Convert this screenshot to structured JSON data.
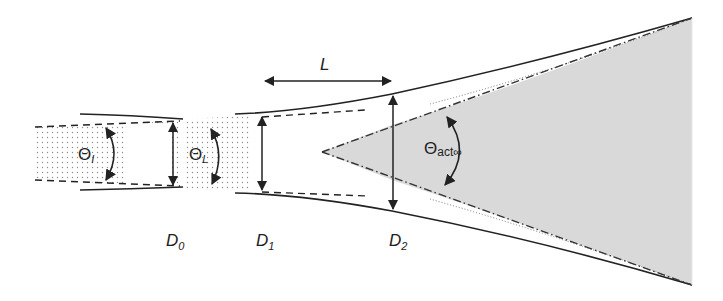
{
  "diagram": {
    "labels": {
      "theta_i": "Θ",
      "theta_i_sub": "I",
      "theta_l": "Θ",
      "theta_l_sub": "L",
      "theta_act": "Θ",
      "theta_act_sub": "act∞",
      "L": "L",
      "D0": "D",
      "D0_sub": "0",
      "D1": "D",
      "D1_sub": "1",
      "D2": "D",
      "D2_sub": "2"
    },
    "colors": {
      "line": "#222222",
      "cone_fill": "#d9d9d9",
      "dots": "#888888",
      "background": "#ffffff"
    }
  }
}
